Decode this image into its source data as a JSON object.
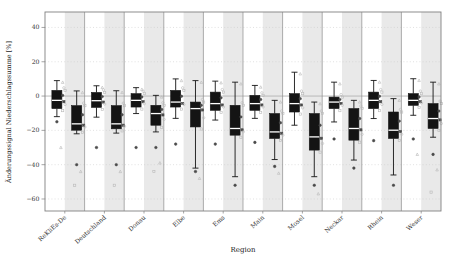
{
  "chart_data": {
    "type": "boxplot",
    "title": "",
    "xlabel": "Region",
    "ylabel": "Änderungssignal Niederschlagssumme [%]",
    "ylim": [
      -67,
      49
    ],
    "yticks": [
      40,
      20,
      0,
      -20,
      -40,
      -60
    ],
    "zero_line": true,
    "grid": "dotted-horizontal",
    "legend": "none",
    "categories": [
      "ReKliEs-De",
      "Deutschland",
      "Donau",
      "Elbe",
      "Ems",
      "Main",
      "Mosel",
      "Neckar",
      "Rhein",
      "Weser"
    ],
    "series": [
      {
        "name": "left-box-per-region",
        "boxes": [
          {
            "whislo": -12.0,
            "q1": -7.3,
            "med": -2.5,
            "q3": 3.3,
            "whishi": 9.0,
            "outliers": [
              -15,
              -30
            ]
          },
          {
            "whislo": -12.3,
            "q1": -6.6,
            "med": -2.7,
            "q3": 2.1,
            "whishi": 6.0,
            "outliers": [
              -30
            ]
          },
          {
            "whislo": -10.2,
            "q1": -6.4,
            "med": -2.5,
            "q3": 1.4,
            "whishi": 4.9,
            "outliers": [
              -30
            ]
          },
          {
            "whislo": -13.0,
            "q1": -6.4,
            "med": -3.5,
            "q3": 3.3,
            "whishi": 10.0,
            "outliers": [
              -28
            ]
          },
          {
            "whislo": -14.0,
            "q1": -8.3,
            "med": -4.4,
            "q3": 2.3,
            "whishi": 8.7,
            "outliers": [
              -28
            ]
          },
          {
            "whislo": -13.0,
            "q1": -8.3,
            "med": -4.4,
            "q3": 0.4,
            "whishi": 6.2,
            "outliers": [
              -27
            ]
          },
          {
            "whislo": -17.0,
            "q1": -9.3,
            "med": -4.4,
            "q3": 1.4,
            "whishi": 13.9,
            "outliers": []
          },
          {
            "whislo": -15.1,
            "q1": -7.3,
            "med": -3.5,
            "q3": -0.6,
            "whishi": 8.1,
            "outliers": [
              -25
            ]
          },
          {
            "whislo": -13.1,
            "q1": -7.3,
            "med": -2.5,
            "q3": 2.3,
            "whishi": 9.1,
            "outliers": [
              -26
            ]
          },
          {
            "whislo": -11.2,
            "q1": -5.4,
            "med": -2.5,
            "q3": 1.4,
            "whishi": 10.1,
            "outliers": [
              -25,
              -34
            ]
          }
        ]
      },
      {
        "name": "right-box-per-region",
        "boxes": [
          {
            "whislo": -22.0,
            "q1": -19.9,
            "med": -16.2,
            "q3": -5.6,
            "whishi": 3.0,
            "outliers": [
              -40,
              -44,
              -52
            ]
          },
          {
            "whislo": -21.6,
            "q1": -19.1,
            "med": -16.2,
            "q3": -5.6,
            "whishi": 3.1,
            "outliers": [
              -40,
              -44,
              -52
            ]
          },
          {
            "whislo": -20.9,
            "q1": -17.0,
            "med": -10.2,
            "q3": -5.4,
            "whishi": 0.4,
            "outliers": [
              -30,
              -39,
              -44
            ]
          },
          {
            "whislo": -42.0,
            "q1": -18.0,
            "med": -7.3,
            "q3": -3.5,
            "whishi": 9.0,
            "outliers": [
              -44,
              -48
            ]
          },
          {
            "whislo": -47.0,
            "q1": -22.8,
            "med": -18.9,
            "q3": -5.4,
            "whishi": 8.1,
            "outliers": [
              -52
            ]
          },
          {
            "whislo": -37.0,
            "q1": -24.7,
            "med": -20.9,
            "q3": -10.2,
            "whishi": -2.5,
            "outliers": [
              -41,
              -45
            ]
          },
          {
            "whislo": -47.0,
            "q1": -31.5,
            "med": -23.8,
            "q3": -10.2,
            "whishi": -3.5,
            "outliers": [
              -52,
              -57
            ]
          },
          {
            "whislo": -37.3,
            "q1": -25.7,
            "med": -18.9,
            "q3": -7.3,
            "whishi": -2.5,
            "outliers": [
              -42
            ]
          },
          {
            "whislo": -46.0,
            "q1": -24.7,
            "med": -19.9,
            "q3": -9.3,
            "whishi": -1.5,
            "outliers": [
              -52
            ]
          },
          {
            "whislo": -24.0,
            "q1": -18.9,
            "med": -13.1,
            "q3": -4.4,
            "whishi": 8.1,
            "outliers": [
              -34,
              -43,
              -56
            ]
          }
        ]
      }
    ],
    "colors": {
      "box_fill": "#141414",
      "median_line": "#ffffff",
      "whisker": "#141414",
      "band": "#e9e9e9",
      "separator": "#8c8c8c",
      "frame": "#808080",
      "zero_line": "#b3b3b3",
      "gridline": "#cccccc",
      "marker_light": "#b8b8b8",
      "marker_dark": "#4a4a4a",
      "text": "#333333"
    }
  }
}
